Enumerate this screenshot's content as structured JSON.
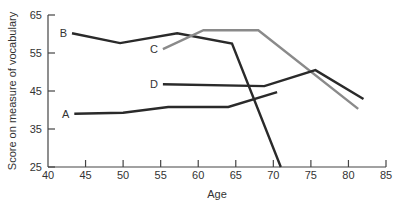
{
  "chart_data": {
    "type": "line",
    "title": "",
    "xlabel": "Age",
    "ylabel": "Score on measure of vocabulary",
    "xlim": [
      40,
      85
    ],
    "ylim": [
      25,
      65
    ],
    "xticks": [
      40,
      45,
      50,
      55,
      60,
      65,
      70,
      75,
      80,
      85
    ],
    "yticks": [
      25,
      35,
      45,
      55,
      65
    ],
    "grid": false,
    "legend": "inline labels at line starts",
    "series": [
      {
        "name": "A",
        "color": "#2a2a2a",
        "points": [
          [
            43.5,
            39.0
          ],
          [
            50,
            39.3
          ],
          [
            56,
            40.8
          ],
          [
            64,
            40.8
          ],
          [
            70.5,
            44.7
          ]
        ]
      },
      {
        "name": "B",
        "color": "#2a2a2a",
        "points": [
          [
            43.2,
            60.2
          ],
          [
            49.6,
            57.6
          ],
          [
            57.2,
            60.2
          ],
          [
            64.5,
            57.5
          ],
          [
            71,
            25
          ]
        ]
      },
      {
        "name": "C",
        "color": "#8a8a8a",
        "points": [
          [
            55.3,
            56.0
          ],
          [
            60.7,
            61.0
          ],
          [
            68,
            61.0
          ],
          [
            81.3,
            40.3
          ]
        ]
      },
      {
        "name": "D",
        "color": "#2a2a2a",
        "points": [
          [
            55.3,
            46.8
          ],
          [
            68.8,
            46.3
          ],
          [
            75.6,
            50.5
          ],
          [
            82,
            42.9
          ]
        ]
      }
    ]
  },
  "axes": {
    "x_label": "Age",
    "y_label": "Score on measure of vocabulary"
  }
}
